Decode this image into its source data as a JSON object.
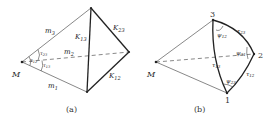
{
  "panels": [
    {
      "id": "a",
      "caption": "(a)",
      "vertex_label": "M",
      "edge_labels": {
        "m1": {
          "base": "m",
          "sub": "1"
        },
        "m2": {
          "base": "m",
          "sub": "2"
        },
        "m3": {
          "base": "m",
          "sub": "3"
        },
        "K13": {
          "base": "K",
          "sub": "13"
        },
        "K23": {
          "base": "K",
          "sub": "23"
        },
        "K12": {
          "base": "K",
          "sub": "12"
        }
      },
      "angle_labels": {
        "t23": {
          "base": "τ",
          "sub": "23"
        },
        "t12": {
          "base": "τ",
          "sub": "12"
        },
        "t13": {
          "base": "τ",
          "sub": "13"
        }
      }
    },
    {
      "id": "b",
      "caption": "(b)",
      "vertex_label": "M",
      "vertex_numbers": [
        "1",
        "2",
        "3"
      ],
      "arc_labels": {
        "t23": {
          "base": "τ",
          "sub": "23"
        },
        "t13": {
          "base": "τ",
          "sub": "13"
        },
        "t12": {
          "base": "τ",
          "sub": "12"
        }
      },
      "angle_labels": {
        "p12": {
          "base": "ψ",
          "sub": "12"
        },
        "p31": {
          "base": "ψ",
          "sub": "31"
        },
        "p23": {
          "base": "ψ",
          "sub": "23"
        }
      }
    }
  ]
}
